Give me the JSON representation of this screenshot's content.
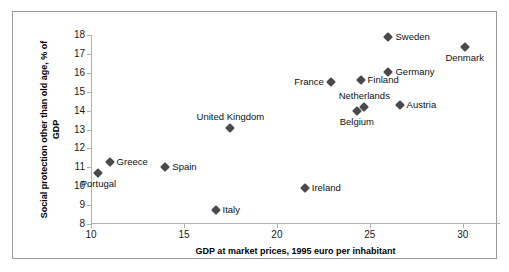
{
  "chart_data": {
    "type": "scatter",
    "title": "",
    "xlabel": "GDP at market prices, 1995 euro per inhabitant",
    "ylabel": "Social protection other than old age, % of GDP",
    "xlim": [
      10,
      32
    ],
    "ylim": [
      8,
      18
    ],
    "xticks": [
      10,
      15,
      20,
      25,
      30
    ],
    "yticks": [
      8,
      9,
      10,
      11,
      12,
      13,
      14,
      15,
      16,
      17,
      18
    ],
    "grid": false,
    "legend": false,
    "marker": "diamond",
    "marker_color": "#4a4a4a",
    "points": [
      {
        "label": "Portugal",
        "x": 10.4,
        "y": 10.7,
        "label_pos": "below"
      },
      {
        "label": "Greece",
        "x": 11.0,
        "y": 11.3,
        "label_pos": "right"
      },
      {
        "label": "Spain",
        "x": 14.0,
        "y": 11.0,
        "label_pos": "right"
      },
      {
        "label": "Italy",
        "x": 16.7,
        "y": 8.75,
        "label_pos": "right"
      },
      {
        "label": "United Kingdom",
        "x": 17.5,
        "y": 13.1,
        "label_pos": "above"
      },
      {
        "label": "Ireland",
        "x": 21.5,
        "y": 9.9,
        "label_pos": "right"
      },
      {
        "label": "France",
        "x": 22.9,
        "y": 15.5,
        "label_pos": "left"
      },
      {
        "label": "Belgium",
        "x": 24.3,
        "y": 14.0,
        "label_pos": "below"
      },
      {
        "label": "Netherlands",
        "x": 24.7,
        "y": 14.2,
        "label_pos": "above"
      },
      {
        "label": "Finland",
        "x": 24.5,
        "y": 15.6,
        "label_pos": "right"
      },
      {
        "label": "Sweden",
        "x": 26.0,
        "y": 17.9,
        "label_pos": "right"
      },
      {
        "label": "Germany",
        "x": 26.0,
        "y": 16.05,
        "label_pos": "right"
      },
      {
        "label": "Austria",
        "x": 26.6,
        "y": 14.3,
        "label_pos": "right"
      },
      {
        "label": "Denmark",
        "x": 30.1,
        "y": 17.35,
        "label_pos": "below"
      }
    ]
  }
}
